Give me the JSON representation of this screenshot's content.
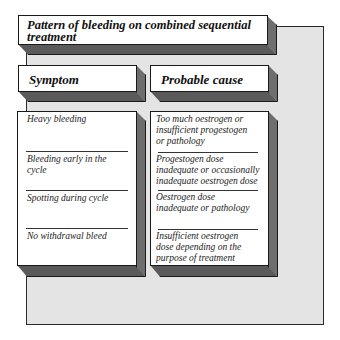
{
  "title": "Pattern of bleeding on combined sequential treatment",
  "headers": {
    "symptom": "Symptom",
    "cause": "Probable cause"
  },
  "rows": [
    {
      "symptom": "Heavy bleeding",
      "cause": "Too much oestrogen or insufficient progestogen or pathology"
    },
    {
      "symptom": "Bleeding early in the cycle",
      "cause": "Progestogen dose inadequate or occasionally inadequate oestrogen dose"
    },
    {
      "symptom": "Spotting during cycle",
      "cause": "Oestrogen dose inadequate or pathology"
    },
    {
      "symptom": "No withdrawal bleed",
      "cause": "Insufficient oestrogen dose depending on the purpose of treatment"
    }
  ],
  "colors": {
    "panel": "#e4e4e4",
    "box_face": "#ffffff",
    "box_shadow": "#5a5a5a"
  }
}
